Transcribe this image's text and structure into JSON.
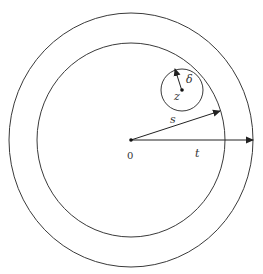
{
  "diagram": {
    "colors": {
      "stroke": "#3a3a3a",
      "background": "#ffffff"
    },
    "labels": {
      "origin": "0",
      "inner_radius": "s",
      "outer_radius": "t",
      "point": "z",
      "small_radius": "δ"
    },
    "shapes": {
      "outer_circle": {
        "cx": 131,
        "cy": 140,
        "rx": 122,
        "ry": 127
      },
      "inner_circle": {
        "cx": 131,
        "cy": 140,
        "rx": 94,
        "ry": 97
      },
      "small_circle": {
        "cx": 182,
        "cy": 90,
        "r": 21
      }
    }
  }
}
